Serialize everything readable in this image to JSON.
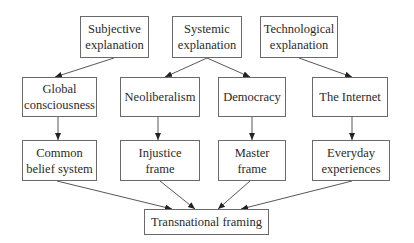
{
  "diagram": {
    "type": "flowchart",
    "nodes": {
      "subjective": {
        "line1": "Subjective",
        "line2": "explanation"
      },
      "systemic": {
        "line1": "Systemic",
        "line2": "explanation"
      },
      "technological": {
        "line1": "Technological",
        "line2": "explanation"
      },
      "global": {
        "line1": "Global",
        "line2": "consciousness"
      },
      "neoliberalism": {
        "line1": "Neoliberalism"
      },
      "democracy": {
        "line1": "Democracy"
      },
      "internet": {
        "line1": "The Internet"
      },
      "common": {
        "line1": "Common",
        "line2": "belief system"
      },
      "injustice": {
        "line1": "Injustice",
        "line2": "frame"
      },
      "master": {
        "line1": "Master",
        "line2": "frame"
      },
      "everyday": {
        "line1": "Everyday",
        "line2": "experiences"
      },
      "transnational": {
        "line1": "Transnational framing"
      }
    },
    "edges": [
      [
        "Subjective explanation",
        "Global consciousness"
      ],
      [
        "Systemic explanation",
        "Neoliberalism"
      ],
      [
        "Systemic explanation",
        "Democracy"
      ],
      [
        "Technological explanation",
        "The Internet"
      ],
      [
        "Global consciousness",
        "Common belief system"
      ],
      [
        "Neoliberalism",
        "Injustice frame"
      ],
      [
        "Democracy",
        "Master frame"
      ],
      [
        "The Internet",
        "Everyday experiences"
      ],
      [
        "Common belief system",
        "Transnational framing"
      ],
      [
        "Injustice frame",
        "Transnational framing"
      ],
      [
        "Master frame",
        "Transnational framing"
      ],
      [
        "Everyday experiences",
        "Transnational framing"
      ]
    ],
    "colors": {
      "stroke": "#6a6a6a",
      "text": "#2a2a2a",
      "background": "#ffffff"
    }
  }
}
